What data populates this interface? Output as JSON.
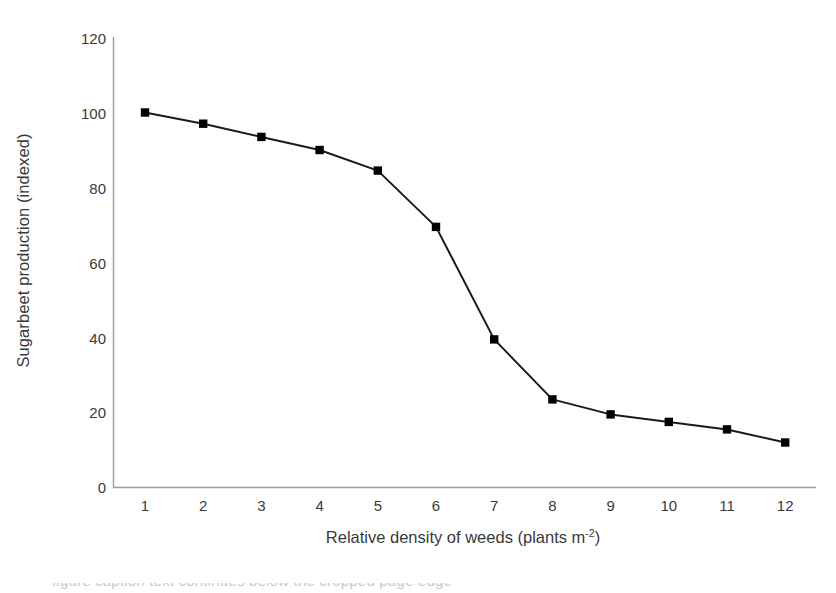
{
  "chart_data": {
    "type": "line",
    "title": "",
    "xlabel": "Relative density of weeds (plants m",
    "xlabel_sup": "-2",
    "xlabel_tail": ")",
    "xlabel_full": "Relative density of weeds (plants m-2)",
    "ylabel": "Sugarbeet production (indexed)",
    "x": [
      1,
      2,
      3,
      4,
      5,
      6,
      7,
      8,
      9,
      10,
      11,
      12
    ],
    "categories": [
      "1",
      "2",
      "3",
      "4",
      "5",
      "6",
      "7",
      "8",
      "9",
      "10",
      "11",
      "12"
    ],
    "values": [
      100,
      97,
      93.5,
      90,
      84.5,
      69.5,
      39.5,
      23.5,
      19.5,
      17.5,
      15.5,
      12
    ],
    "series": [
      {
        "name": "Sugarbeet production (indexed)",
        "values": [
          100,
          97,
          93.5,
          90,
          84.5,
          69.5,
          39.5,
          23.5,
          19.5,
          17.5,
          15.5,
          12
        ]
      }
    ],
    "ylim": [
      0,
      120
    ],
    "yticks": [
      0,
      20,
      40,
      60,
      80,
      100,
      120
    ],
    "ytick_labels": [
      "0",
      "20",
      "40",
      "60",
      "80",
      "100",
      "120"
    ],
    "xlim": [
      0.5,
      12.5
    ],
    "grid": false,
    "legend": false,
    "marker": "square",
    "line_color": "#1a1a1a",
    "marker_color": "#000000",
    "axis_color": "#9a9a9a",
    "background": "#ffffff"
  },
  "caption_sliver": "figure caption text continues below the cropped page edge"
}
